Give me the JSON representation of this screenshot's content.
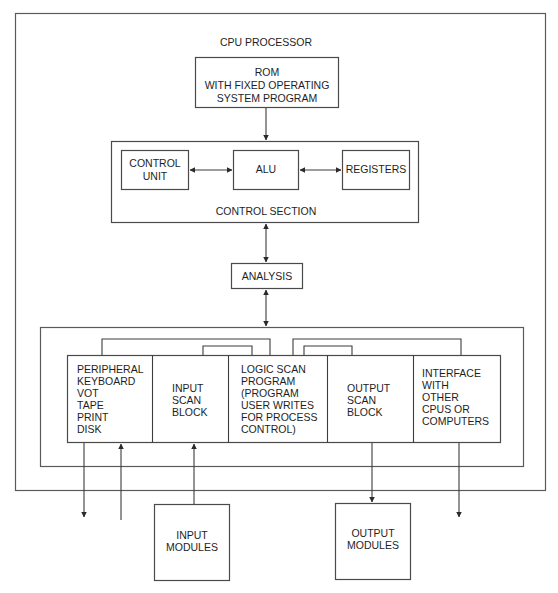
{
  "title": "CPU PROCESSOR",
  "rom": {
    "lines": [
      "ROM",
      "WITH FIXED OPERATING",
      "SYSTEM PROGRAM"
    ]
  },
  "control_section": {
    "label": "CONTROL SECTION",
    "control_unit": [
      "CONTROL",
      "UNIT"
    ],
    "alu": "ALU",
    "registers": "REGISTERS"
  },
  "analysis": "ANALYSIS",
  "scan_blocks": [
    {
      "id": "peripheral",
      "lines": [
        "PERIPHERAL",
        "KEYBOARD",
        "VOT",
        "TAPE",
        "PRINT",
        "DISK"
      ]
    },
    {
      "id": "input-scan",
      "lines": [
        "INPUT",
        "SCAN",
        "BLOCK"
      ]
    },
    {
      "id": "logic-scan",
      "lines": [
        "LOGIC SCAN",
        "PROGRAM",
        "(PROGRAM",
        "USER WRITES",
        "FOR PROCESS",
        "CONTROL)"
      ]
    },
    {
      "id": "output-scan",
      "lines": [
        "OUTPUT",
        "SCAN",
        "BLOCK"
      ]
    },
    {
      "id": "interface",
      "lines": [
        "INTERFACE",
        "WITH",
        "OTHER",
        "CPUS OR",
        "COMPUTERS"
      ]
    }
  ],
  "input_modules": [
    "INPUT",
    "MODULES"
  ],
  "output_modules": [
    "OUTPUT",
    "MODULES"
  ],
  "colors": {
    "line": "#3c3c3c",
    "text": "#1e1e1e",
    "background": "#ffffff"
  }
}
